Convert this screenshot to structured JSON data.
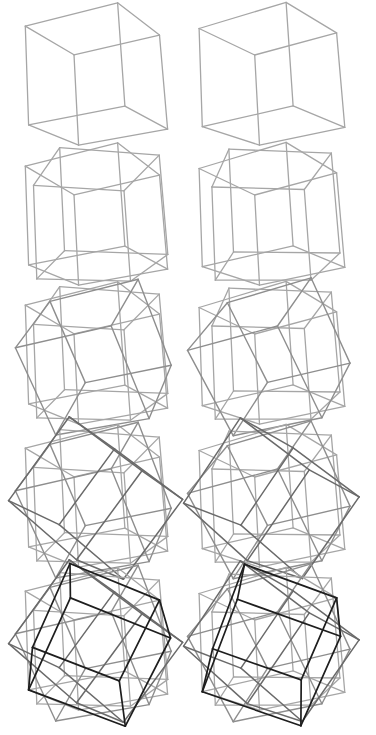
{
  "figure": {
    "background": "#ffffff",
    "rows": [
      {
        "cubes": 1,
        "cy": 78
      },
      {
        "cubes": 2,
        "cy": 218
      },
      {
        "cubes": 3,
        "cy": 357
      },
      {
        "cubes": 4,
        "cy": 500
      },
      {
        "cubes": 5,
        "cy": 643
      }
    ],
    "columns": [
      {
        "eye": "left",
        "cx": 97,
        "yaw_offset": 0
      },
      {
        "eye": "right",
        "cx": 272,
        "yaw_offset": 0.09
      }
    ],
    "cube_size": 62,
    "cube_colors": [
      "#a6a6a6",
      "#a6a6a6",
      "#8e8e8e",
      "#6a6a6a",
      "#1e1e1e"
    ],
    "cube_widths": [
      1.3,
      1.3,
      1.4,
      1.5,
      1.7
    ],
    "base_rotation": {
      "yaw": 0.45,
      "pitch": 0.32,
      "roll": 0.06
    },
    "compound_axes": [
      {
        "axis": [
          0,
          0,
          1
        ],
        "angle": 0
      },
      {
        "axis": [
          0,
          1,
          0
        ],
        "angle": 0.785
      },
      {
        "axis": [
          1,
          0,
          0
        ],
        "angle": 0.785
      },
      {
        "axis": [
          0,
          0,
          1
        ],
        "angle": 0.785
      },
      {
        "axis": [
          1,
          1,
          1
        ],
        "angle": 1.05
      }
    ]
  }
}
